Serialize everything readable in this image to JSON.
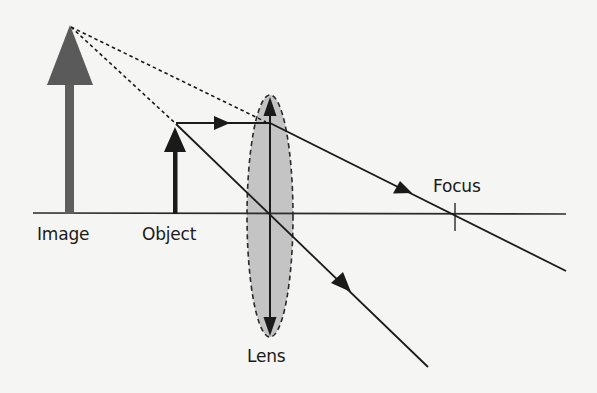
{
  "diagram": {
    "type": "ray-diagram",
    "labels": {
      "image": "Image",
      "object": "Object",
      "focus": "Focus",
      "lens": "Lens"
    },
    "colors": {
      "background": "#f5f5f3",
      "ray": "#1a1a1a",
      "image_arrow": "#5a5a5a",
      "lens_fill": "#c4c4c4",
      "lens_outline": "#2a2a2a"
    },
    "elements": {
      "optical_axis": {
        "x1": 33,
        "x2": 566,
        "y": 213
      },
      "image_arrow": {
        "x": 70,
        "base_y": 213,
        "tip_y": 25,
        "style": "thick gray"
      },
      "object_arrow": {
        "x": 175,
        "base_y": 213,
        "tip_y": 125,
        "style": "black"
      },
      "lens": {
        "cx": 270,
        "cy": 216,
        "rx": 23,
        "ry": 121,
        "style": "dashed ellipse, gray fill, double-headed vertical arrow"
      },
      "focus_point": {
        "x": 455,
        "y": 213
      },
      "rays": [
        {
          "name": "parallel-ray",
          "description": "Horizontal from object tip to lens, then refracted through focus",
          "arrows": 2
        },
        {
          "name": "center-ray",
          "description": "From object tip straight through lens center",
          "arrows": 1
        },
        {
          "name": "virtual-extension-1",
          "description": "Dashed back-extension from lens to image tip",
          "dashed": true
        },
        {
          "name": "virtual-extension-2",
          "description": "Dashed back-extension from object tip to image tip",
          "dashed": true
        }
      ]
    }
  }
}
